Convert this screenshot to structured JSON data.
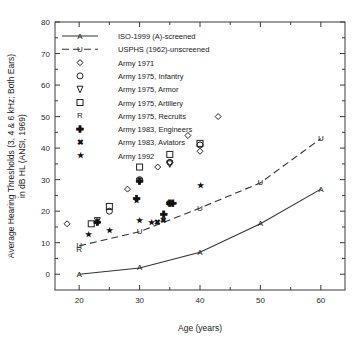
{
  "chart_data": {
    "type": "scatter",
    "title": "",
    "xlabel": "Age (years)",
    "ylabel": "Average Hearing Thresholds (3, 4 & 6 kHz; Both Ears) in dB HL (ANSI, 1969)",
    "ylabel_line1": "Average Hearing Thresholds (3, 4 & 6 kHz; Both Ears)",
    "ylabel_line2": "in dB HL (ANSI, 1969)",
    "xlim": [
      16,
      64
    ],
    "ylim": [
      -5,
      80
    ],
    "xticks": [
      20,
      30,
      40,
      50,
      60
    ],
    "yticks": [
      0,
      10,
      20,
      30,
      40,
      50,
      60,
      70,
      80
    ],
    "xtick_labels": [
      "20",
      "30",
      "40",
      "50",
      "60"
    ],
    "ytick_labels": [
      "0",
      "10",
      "20",
      "30",
      "40",
      "50",
      "60",
      "70",
      "80"
    ],
    "minor_ticks": true,
    "grid": false,
    "legend_position": "upper-left-inside",
    "series": [
      {
        "name": "ISO-1999 (A)-screened",
        "marker": "letter-A",
        "style": "solid-line",
        "points": [
          {
            "x": 20,
            "y": 0
          },
          {
            "x": 30,
            "y": 2
          },
          {
            "x": 40,
            "y": 7
          },
          {
            "x": 50,
            "y": 16
          },
          {
            "x": 60,
            "y": 27
          }
        ]
      },
      {
        "name": "USPHS (1962)-unscreened",
        "marker": "letter-U",
        "style": "dashed-line",
        "points": [
          {
            "x": 20,
            "y": 9
          },
          {
            "x": 30,
            "y": 13.5
          },
          {
            "x": 40,
            "y": 21
          },
          {
            "x": 50,
            "y": 29
          },
          {
            "x": 60,
            "y": 43
          }
        ]
      },
      {
        "name": "Army 1971",
        "marker": "diamond-open",
        "style": "points",
        "points": [
          {
            "x": 18,
            "y": 16
          },
          {
            "x": 23,
            "y": 16.5
          },
          {
            "x": 28,
            "y": 27
          },
          {
            "x": 33,
            "y": 34
          },
          {
            "x": 35,
            "y": 35.5
          },
          {
            "x": 38,
            "y": 44
          },
          {
            "x": 40,
            "y": 39
          },
          {
            "x": 43,
            "y": 50
          }
        ]
      },
      {
        "name": "Army 1975, Infantry",
        "marker": "circle-open",
        "style": "points",
        "points": [
          {
            "x": 25,
            "y": 20
          },
          {
            "x": 30,
            "y": 30
          },
          {
            "x": 35,
            "y": 35.5
          },
          {
            "x": 40,
            "y": 41
          }
        ]
      },
      {
        "name": "Army 1975, Armor",
        "marker": "triangle-down-open",
        "style": "points",
        "points": [
          {
            "x": 23,
            "y": 17
          },
          {
            "x": 30,
            "y": 29.5
          },
          {
            "x": 35,
            "y": 35
          }
        ]
      },
      {
        "name": "Army 1975, Artillery",
        "marker": "square-open",
        "style": "points",
        "points": [
          {
            "x": 22,
            "y": 16
          },
          {
            "x": 25,
            "y": 21.5
          },
          {
            "x": 30,
            "y": 34
          },
          {
            "x": 35,
            "y": 38
          },
          {
            "x": 40,
            "y": 41.5
          }
        ]
      },
      {
        "name": "Army 1975, Recruits",
        "marker": "letter-R",
        "style": "points",
        "points": [
          {
            "x": 20,
            "y": 8
          }
        ]
      },
      {
        "name": "Army 1983, Engineers",
        "marker": "plus-filled",
        "style": "points",
        "points": [
          {
            "x": 23,
            "y": 16.5
          },
          {
            "x": 29.5,
            "y": 24
          },
          {
            "x": 30,
            "y": 29.5
          },
          {
            "x": 34,
            "y": 19
          },
          {
            "x": 35,
            "y": 22.5
          },
          {
            "x": 35.5,
            "y": 22.5
          }
        ]
      },
      {
        "name": "Army 1983, Aviators",
        "marker": "x-filled",
        "style": "points",
        "points": [
          {
            "x": 33,
            "y": 16.5
          },
          {
            "x": 34,
            "y": 17
          },
          {
            "x": 35,
            "y": 22.5
          }
        ]
      },
      {
        "name": "Army 1992",
        "marker": "star-filled",
        "style": "points",
        "points": [
          {
            "x": 21.5,
            "y": 12.5
          },
          {
            "x": 25,
            "y": 14
          },
          {
            "x": 29.5,
            "y": 23.5
          },
          {
            "x": 30,
            "y": 17
          },
          {
            "x": 32,
            "y": 16.5
          },
          {
            "x": 40,
            "y": 28
          }
        ]
      }
    ],
    "legend_entries": [
      {
        "label": "ISO-1999 (A)-screened",
        "marker": "letter-A",
        "style": "solid-line"
      },
      {
        "label": "USPHS (1962)-unscreened",
        "marker": "letter-U",
        "style": "dashed-line"
      },
      {
        "label": "Army 1971",
        "marker": "diamond-open",
        "style": "points"
      },
      {
        "label": "Army 1975, Infantry",
        "marker": "circle-open",
        "style": "points"
      },
      {
        "label": "Army 1975, Armor",
        "marker": "triangle-down-open",
        "style": "points"
      },
      {
        "label": "Army 1975, Artillery",
        "marker": "square-open",
        "style": "points"
      },
      {
        "label": "Army 1975, Recruits",
        "marker": "letter-R",
        "style": "points"
      },
      {
        "label": "Army 1983, Engineers",
        "marker": "plus-filled",
        "style": "points"
      },
      {
        "label": "Army 1983, Aviators",
        "marker": "x-filled",
        "style": "points"
      },
      {
        "label": "Army 1992",
        "marker": "star-filled",
        "style": "points"
      }
    ]
  },
  "colors": {
    "background": "#ffffff",
    "axis": "#3a3a3a",
    "text": "#1a1a1a",
    "marker": "#222222"
  }
}
